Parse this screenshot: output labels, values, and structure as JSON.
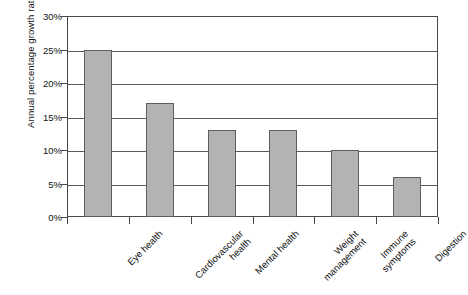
{
  "chart_data": {
    "type": "bar",
    "title": "",
    "subtitle": "",
    "xlabel": "",
    "ylabel": "Annual percentage growth rate",
    "categories": [
      "Eye health",
      "Cardiovascular health",
      "Mental health",
      "Weight management",
      "Immune symptoms",
      "Digestion"
    ],
    "category_lines": [
      [
        "Eye health"
      ],
      [
        "Cardiovascular",
        "health"
      ],
      [
        "Mental health"
      ],
      [
        "Weight",
        "management"
      ],
      [
        "Immune",
        "symptoms"
      ],
      [
        "Digestion"
      ]
    ],
    "values": [
      25,
      17,
      13,
      13,
      10,
      6
    ],
    "value_unit": "%",
    "ylim": [
      0,
      30
    ],
    "ytick_values": [
      0,
      5,
      10,
      15,
      20,
      25,
      30
    ],
    "ytick_labels": [
      "0%",
      "5%",
      "10%",
      "15%",
      "20%",
      "25%",
      "30%"
    ],
    "grid": true,
    "grid_axis": "y",
    "legend": false,
    "legend_position": "none",
    "bar_color": "#b3b3b3",
    "bar_border_color": "#5e5e5e",
    "axis_color": "#4a4a4a",
    "grid_color": "#5a5a5a",
    "background_color": "#ffffff",
    "text_color": "#111111"
  }
}
